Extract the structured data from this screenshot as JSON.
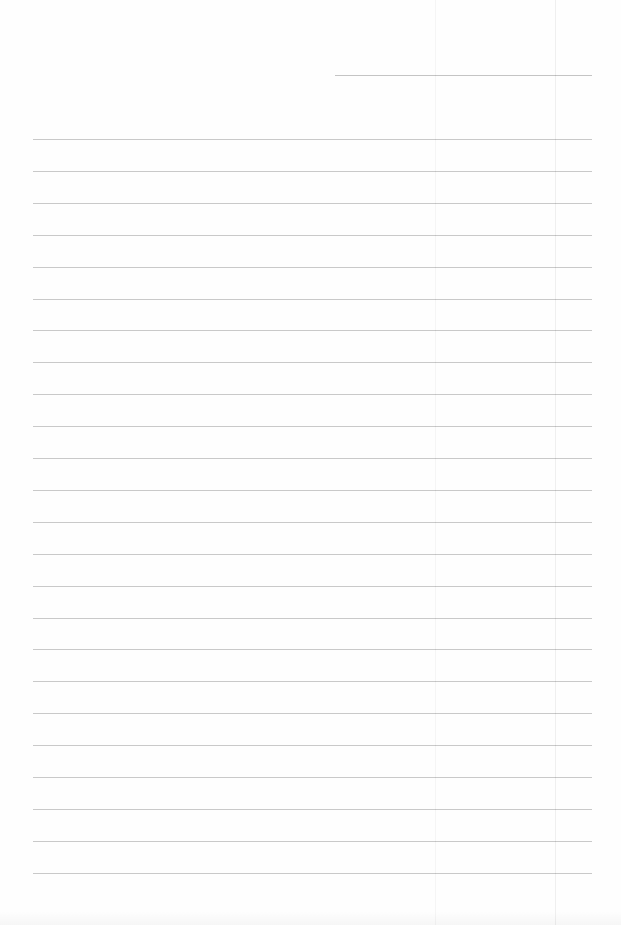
{
  "page": {
    "type": "blank lined notebook page",
    "background_color": "#fefefe",
    "rule_color": "#c9c9c9",
    "date_line": {
      "x1": 335,
      "x2": 592,
      "y": 75
    },
    "rules": {
      "x1": 33,
      "x2": 592,
      "first_y": 139,
      "spacing": 31.9,
      "count": 24
    },
    "folds_x": [
      435,
      555
    ]
  }
}
